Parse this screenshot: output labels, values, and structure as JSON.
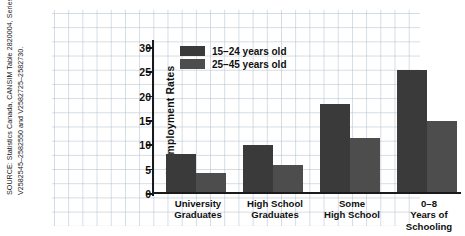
{
  "source_note": "SOURCE: Statistics Canada, CANSIM Table 2820004, Series V2582545–2582550 and V2582725–2582730.",
  "legend": {
    "position": "inside-top-left",
    "entries": [
      {
        "label": "15–24 years old",
        "color": "#3a3a3a"
      },
      {
        "label": "25–45 years old",
        "color": "#4d4d4d"
      }
    ]
  },
  "axis": {
    "ylabel": "Unemployment Rates",
    "yticks": [
      "0",
      "5",
      "10",
      "15",
      "20",
      "25",
      "30"
    ]
  },
  "chart_data": {
    "type": "bar",
    "title": "",
    "xlabel": "",
    "ylabel": "Unemployment Rates",
    "ylim": [
      0,
      30
    ],
    "yticks": [
      0,
      5,
      10,
      15,
      20,
      25,
      30
    ],
    "grid": true,
    "legend_position": "inside-top-left",
    "categories": [
      "University\nGraduates",
      "High School\nGraduates",
      "Some\nHigh School",
      "0–8\nYears of\nSchooling"
    ],
    "series": [
      {
        "name": "15–24 years old",
        "color": "#3a3a3a",
        "values": [
          7.9,
          9.7,
          18.0,
          25.0
        ]
      },
      {
        "name": "25–45 years old",
        "color": "#4d4d4d",
        "values": [
          4.0,
          5.5,
          11.0,
          14.6
        ]
      }
    ]
  }
}
